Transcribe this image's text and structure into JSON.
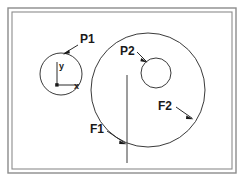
{
  "figure": {
    "background_color": "#ffffff",
    "frame": {
      "name": "border-frame",
      "style": "double-line rectangle",
      "outer_color": "#8c8c8c",
      "inner_color": "#8c8c8c",
      "outer": {
        "x": 8,
        "y": 8,
        "width": 228,
        "height": 165
      },
      "inner": {
        "x": 12,
        "y": 12,
        "width": 220,
        "height": 157
      }
    },
    "stroke_color": "#3a3a3a",
    "label_color": "#1a1a1a"
  },
  "shapes": {
    "small_circle": {
      "name": "circle-p1",
      "cx": 61,
      "cy": 74,
      "r": 21
    },
    "large_circle": {
      "name": "circle-f2",
      "cx": 148,
      "cy": 90,
      "r": 57
    },
    "inner_circle": {
      "name": "circle-p2",
      "cx": 156,
      "cy": 73,
      "r": 15
    },
    "vertical_line": {
      "name": "line-f1",
      "x": 127,
      "y1": 75,
      "y2": 163
    }
  },
  "axes": {
    "origin": {
      "x": 57,
      "y": 85
    },
    "y_axis": {
      "x": 57,
      "y1": 62,
      "y2": 85
    },
    "x_axis": {
      "y": 85,
      "x1": 57,
      "x2": 79
    },
    "y_label": "y",
    "x_label": "x",
    "y_label_pos": {
      "x": 59,
      "y": 69
    },
    "x_label_pos": {
      "x": 74,
      "y": 89
    }
  },
  "labels": [
    {
      "id": "p1",
      "text": "P1",
      "text_pos": {
        "x": 80,
        "y": 43
      },
      "leader": {
        "x1": 78,
        "y1": 45,
        "x2": 63,
        "y2": 54
      },
      "arrow_at": {
        "x": 63,
        "y": 54
      },
      "arrow_angle": 150,
      "points_to": "circle-p1"
    },
    {
      "id": "p2",
      "text": "P2",
      "text_pos": {
        "x": 120,
        "y": 55
      },
      "leader": {
        "x1": 137,
        "y1": 52,
        "x2": 147,
        "y2": 62
      },
      "arrow_at": {
        "x": 147,
        "y": 62
      },
      "arrow_angle": 45,
      "points_to": "circle-p2"
    },
    {
      "id": "f2",
      "text": "F2",
      "text_pos": {
        "x": 158,
        "y": 110
      },
      "leader": {
        "x1": 176,
        "y1": 107,
        "x2": 193,
        "y2": 119
      },
      "arrow_at": {
        "x": 193,
        "y": 119
      },
      "arrow_angle": 35,
      "points_to": "circle-f2"
    },
    {
      "id": "f1",
      "text": "F1",
      "text_pos": {
        "x": 90,
        "y": 133
      },
      "leader": {
        "x1": 107,
        "y1": 131,
        "x2": 126,
        "y2": 144
      },
      "arrow_at": {
        "x": 126,
        "y": 144
      },
      "arrow_angle": 35,
      "points_to": "line-f1"
    }
  ]
}
